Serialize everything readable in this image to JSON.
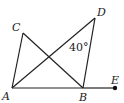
{
  "figure": {
    "points": [
      {
        "name": "A",
        "x": 12,
        "y": 88,
        "label_x": 2,
        "label_y": 100
      },
      {
        "name": "B",
        "x": 83,
        "y": 88,
        "label_x": 79,
        "label_y": 101
      },
      {
        "name": "C",
        "x": 23,
        "y": 33,
        "label_x": 12,
        "label_y": 31
      },
      {
        "name": "D",
        "x": 95,
        "y": 18,
        "label_x": 97,
        "label_y": 16
      },
      {
        "name": "E",
        "x": 115,
        "y": 88,
        "label_x": 111,
        "label_y": 84
      }
    ],
    "segments": [
      [
        "A",
        "B"
      ],
      [
        "B",
        "E"
      ],
      [
        "A",
        "C"
      ],
      [
        "C",
        "B"
      ],
      [
        "A",
        "D"
      ],
      [
        "D",
        "B"
      ]
    ],
    "angle_label": {
      "text": "40°",
      "x": 69,
      "y": 51
    },
    "labels": {
      "A": "A",
      "B": "B",
      "C": "C",
      "D": "D",
      "E": "E"
    }
  }
}
